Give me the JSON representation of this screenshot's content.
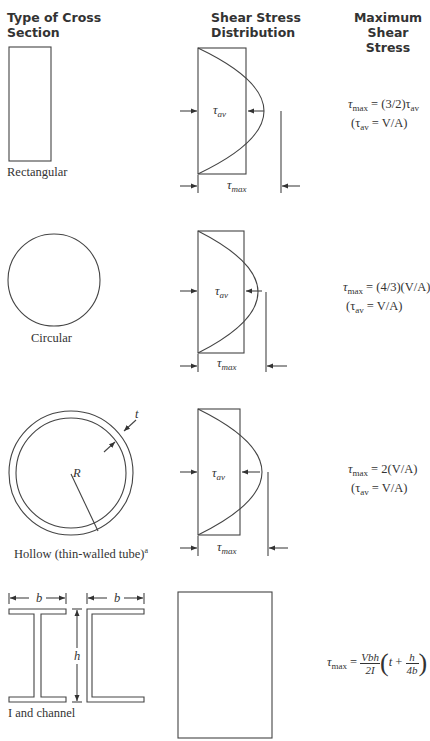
{
  "headers": {
    "type_line1": "Type of Cross",
    "type_line2": "Section",
    "dist_line1": "Shear Stress",
    "dist_line2": "Distribution",
    "max_line1": "Maximum",
    "max_line2": "Shear Stress"
  },
  "rows": [
    {
      "section_label": "Rectangular",
      "tau_av_label": "τ",
      "tau_av_sub": "av",
      "tau_max_label": "τ",
      "tau_max_sub": "max",
      "formula_line1_lhs": "τ",
      "formula_line1_lhs_sub": "max",
      "formula_line1_rhs": " = (3/2)τ",
      "formula_line1_rhs_sub": "av",
      "formula_line2_pre": "(τ",
      "formula_line2_sub": "av",
      "formula_line2_post": " = V/A)"
    },
    {
      "section_label": "Circular",
      "tau_av_label": "τ",
      "tau_av_sub": "av",
      "tau_max_label": "τ",
      "tau_max_sub": "max",
      "formula_line1_lhs": "τ",
      "formula_line1_lhs_sub": "max",
      "formula_line1_rhs": " = (4/3)(V/A)",
      "formula_line2_pre": "(τ",
      "formula_line2_sub": "av",
      "formula_line2_post": " = V/A)"
    },
    {
      "section_label": "Hollow (thin-walled tube)",
      "section_label_sup": "a",
      "radius_label": "R",
      "thickness_label": "t",
      "tau_av_label": "τ",
      "tau_av_sub": "av",
      "tau_max_label": "τ",
      "tau_max_sub": "max",
      "formula_line1_lhs": "τ",
      "formula_line1_lhs_sub": "max",
      "formula_line1_rhs": " = 2(V/A)",
      "formula_line2_pre": "(τ",
      "formula_line2_sub": "av",
      "formula_line2_post": " = V/A)"
    },
    {
      "section_label": "I and channel",
      "width_label_1": "b",
      "width_label_2": "b",
      "height_label": "h",
      "formula_lhs": "τ",
      "formula_lhs_sub": "max",
      "formula_eq": " = ",
      "frac1_num": "Vbh",
      "frac1_den": "2I",
      "paren_open": "(",
      "inner_t": "t",
      "inner_plus": " + ",
      "frac2_num": "h",
      "frac2_den": "4b",
      "paren_close": ")"
    }
  ]
}
